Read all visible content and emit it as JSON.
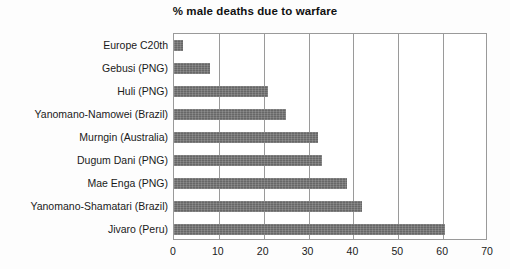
{
  "chart_data": {
    "type": "bar",
    "orientation": "horizontal",
    "title": "% male deaths due to warfare",
    "xlabel": "",
    "ylabel": "",
    "xlim": [
      0,
      70
    ],
    "xticks": [
      0,
      10,
      20,
      30,
      40,
      50,
      60,
      70
    ],
    "xtick_labels": [
      "0",
      "10",
      "20",
      "30",
      "40",
      "50",
      "60",
      "70"
    ],
    "grid": "vertical",
    "legend": "none",
    "bar_color": "#6d6d6d",
    "categories": [
      "Europe C20th",
      "Gebusi (PNG)",
      "Huli (PNG)",
      "Yanomano-Namowei (Brazil)",
      "Murngin (Australia)",
      "Dugum Dani (PNG)",
      "Mae Enga (PNG)",
      "Yanomano-Shamatari (Brazil)",
      "Jivaro (Peru)"
    ],
    "values": [
      2,
      8,
      21,
      25,
      32,
      33,
      38.5,
      42,
      60.5
    ]
  }
}
